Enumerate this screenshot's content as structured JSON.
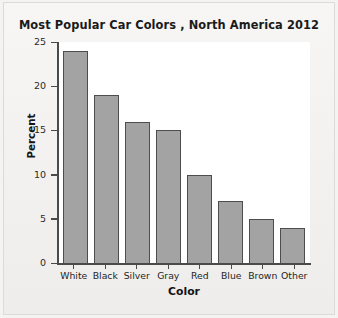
{
  "chart_data": {
    "type": "bar",
    "title": "Most Popular Car Colors , North America 2012",
    "xlabel": "Color",
    "ylabel": "Percent",
    "categories": [
      "White",
      "Black",
      "Silver",
      "Gray",
      "Red",
      "Blue",
      "Brown",
      "Other"
    ],
    "values": [
      24,
      19,
      16,
      15,
      10,
      7,
      5,
      4
    ],
    "ylim": [
      0,
      25
    ],
    "yticks": [
      0,
      5,
      10,
      15,
      20,
      25
    ],
    "ytick_labels": [
      "0",
      "5",
      "10",
      "15",
      "20",
      "25"
    ],
    "grid": false,
    "legend": "none",
    "bar_color": "#a3a3a3",
    "bar_edge_color": "#4d4d4d",
    "plot_background": "#ffffff",
    "figure_background": "#f4f3f1",
    "axis_color": "#4a4a4a"
  }
}
